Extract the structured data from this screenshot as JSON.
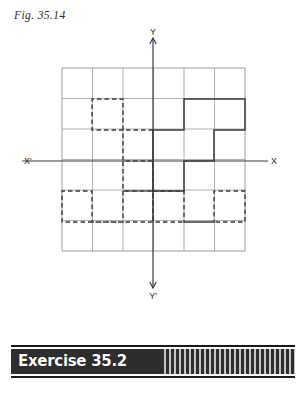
{
  "figure": {
    "caption": "Fig. 35.14",
    "axes": {
      "x_positive_label": "X",
      "x_negative_label": "X'",
      "y_positive_label": "Y",
      "y_negative_label": "Y'",
      "x_axis_y": 161,
      "y_axis_x": 153
    },
    "grid": {
      "left": 62,
      "top": 68,
      "cell": 30.5,
      "cols": 6,
      "rows": 6,
      "line_color": "#9a9a9a"
    },
    "colors": {
      "grid": "#9a9a9a",
      "axis": "#3a3a3a",
      "shape_solid": "#3a3a3a",
      "shape_dashed": "#3a3a3a",
      "banner_bg": "#2e2e2e",
      "banner_text": "#ffffff"
    },
    "shapes": [
      {
        "name": "staircase-solid-quadrant-1",
        "style": "solid",
        "quadrant": "upper-right",
        "points": "153,130 184,130 184,99 245,99 245,130 214,130 214,161 184,161 184,191 153,191 153,161 153,130"
      },
      {
        "name": "staircase-dashed-quadrant-2",
        "style": "dashed",
        "quadrant": "upper-left",
        "points": "153,130 123,130 123,99 92,99 92,130 123,130 123,161 153,161 153,191 123,191 123,161"
      },
      {
        "name": "staircase-dashed-quadrant-3",
        "style": "dashed",
        "quadrant": "lower-left",
        "points": "153,191 123,191 123,222 92,222 92,191 62,191 62,222 123,222 153,222 153,191"
      },
      {
        "name": "staircase-dashed-quadrant-4",
        "style": "dashed",
        "quadrant": "lower-right",
        "points": "153,191 184,191 184,222 214,222 214,191 245,191 245,222 184,222 153,222 153,191"
      }
    ]
  },
  "banner": {
    "label": "Exercise 35.2"
  }
}
